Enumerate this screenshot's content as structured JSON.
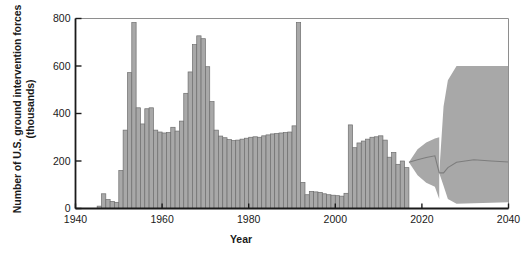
{
  "chart_data": {
    "type": "bar",
    "title": "",
    "xlabel": "Year",
    "ylabel": "Number of U.S. ground intervention forces (thousands)",
    "xlim": [
      1940,
      2040
    ],
    "ylim": [
      0,
      800
    ],
    "xticks": [
      1940,
      1960,
      1980,
      2000,
      2020,
      2040
    ],
    "yticks": [
      0,
      200,
      400,
      600,
      800
    ],
    "grid": false,
    "legend": "none",
    "bar_color": "#a8a8a8",
    "bar_edge_color": "#6e6e6e",
    "band_color": "#a8a8a8",
    "axis_color": "#1a1a1a",
    "categories": [
      1945,
      1946,
      1947,
      1948,
      1949,
      1950,
      1951,
      1952,
      1953,
      1954,
      1955,
      1956,
      1957,
      1958,
      1959,
      1960,
      1961,
      1962,
      1963,
      1964,
      1965,
      1966,
      1967,
      1968,
      1969,
      1970,
      1971,
      1972,
      1973,
      1974,
      1975,
      1976,
      1977,
      1978,
      1979,
      1980,
      1981,
      1982,
      1983,
      1984,
      1985,
      1986,
      1987,
      1988,
      1989,
      1990,
      1991,
      1992,
      1993,
      1994,
      1995,
      1996,
      1997,
      1998,
      1999,
      2000,
      2001,
      2002,
      2003,
      2004,
      2005,
      2006,
      2007,
      2008,
      2009,
      2010,
      2011,
      2012,
      2013,
      2014,
      2015,
      2016
    ],
    "values": [
      10,
      62,
      38,
      30,
      26,
      160,
      330,
      572,
      783,
      424,
      356,
      420,
      424,
      330,
      322,
      318,
      320,
      342,
      326,
      368,
      485,
      575,
      690,
      727,
      715,
      597,
      450,
      330,
      305,
      298,
      290,
      286,
      288,
      292,
      296,
      300,
      302,
      300,
      306,
      310,
      314,
      316,
      318,
      320,
      322,
      348,
      783,
      110,
      58,
      72,
      70,
      68,
      62,
      58,
      56,
      54,
      52,
      64,
      352,
      256,
      276,
      284,
      292,
      300,
      302,
      306,
      288,
      216,
      236,
      186,
      200,
      172
    ],
    "series_note": "annual U.S. ground intervention force levels",
    "projection": {
      "label": "projected range",
      "start_year": 2017,
      "end_year": 2040,
      "lobe_a": {
        "years": [
          2017,
          2019,
          2021,
          2023,
          2024
        ],
        "upper": [
          195,
          250,
          278,
          295,
          300
        ],
        "lower": [
          195,
          140,
          108,
          92,
          40
        ],
        "median": [
          195,
          205,
          215,
          222,
          150
        ]
      },
      "lobe_b": {
        "years": [
          2024,
          2025,
          2026,
          2028,
          2032,
          2036,
          2040
        ],
        "upper": [
          150,
          430,
          540,
          600,
          600,
          600,
          600
        ],
        "lower": [
          150,
          96,
          40,
          20,
          22,
          24,
          26
        ],
        "median": [
          150,
          150,
          172,
          195,
          205,
          200,
          196
        ]
      }
    }
  }
}
